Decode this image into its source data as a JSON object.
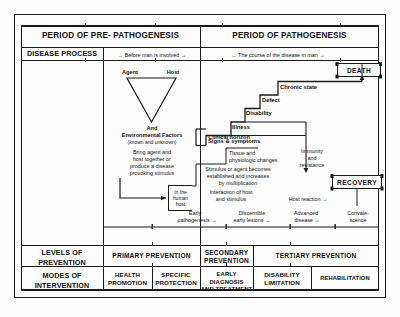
{
  "diagram": {
    "periods": [
      {
        "label": "PERIOD OF PRE- PATHOGENESIS"
      },
      {
        "label": "PERIOD OF PATHOGENESIS"
      }
    ],
    "row_labels": {
      "disease_process": "DISEASE PROCESS",
      "levels_of_prevention": "LEVELS OF\nPREVENTION",
      "modes_of_intervention": "MODES OF\nINTERVENTION"
    },
    "disease_process": {
      "pre": "Before man is involved",
      "path": "The course of the disease in man",
      "arrow_left": "→",
      "arrow_right": "→"
    },
    "epidemiologic_triad": {
      "agent": "Agent",
      "host": "Host",
      "and": "And",
      "environmental_factors": "Environmental Factors",
      "known_unknown": "(known  and unknown)",
      "action_line1": "Bring agent and",
      "action_line2": "host together or",
      "action_line3": "produce  a disease",
      "action_line4": "provoking stimulus"
    },
    "human_host_box": {
      "line1": "In the",
      "line2": "human",
      "line3": "host"
    },
    "pathogenesis_notes": {
      "interaction_line1": "Interaction of host",
      "interaction_line2": "and stimulus",
      "stimulus_line1": "Stimulus or agent becomes",
      "stimulus_line2": "established  and increases",
      "stimulus_line3": "by multiplication",
      "tissue_line1": "Tissue and",
      "tissue_line2": "physiologic changes",
      "clinical_horizon": "Clinical horizon",
      "immunity_line1": "Immunity",
      "immunity_line2": "and",
      "immunity_line3": "resistance",
      "host_reaction": "Host reaction",
      "host_reaction_arrow": "→"
    },
    "outcomes": {
      "death": "DEATH",
      "recovery": "RECOVERY"
    },
    "steps": [
      {
        "label": "Signs & symptoms"
      },
      {
        "label": "Illness"
      },
      {
        "label": "Disability"
      },
      {
        "label": "Defect"
      },
      {
        "label": "Chronic state"
      }
    ],
    "stage_axis": [
      {
        "line1": "Early",
        "line2": "pathogenesis",
        "arrow": "→"
      },
      {
        "line1": "Discernible",
        "line2": "early lesions",
        "arrow": "→"
      },
      {
        "line1": "Advanced",
        "line2": "disease",
        "arrow": "→"
      },
      {
        "line1": "Convale-",
        "line2": "scence",
        "arrow": ""
      }
    ],
    "levels_of_prevention": [
      {
        "label": "PRIMARY PREVENTION"
      },
      {
        "label": "SECONDARY\nPREVENTION"
      },
      {
        "label": "TERTIARY PREVENTION"
      }
    ],
    "modes_of_intervention": [
      {
        "label": "HEALTH\nPROMOTION"
      },
      {
        "label": "SPECIFIC\nPROTECTION"
      },
      {
        "label": "EARLY DIAGNOSIS\nAND TREATMENT"
      },
      {
        "label": "DISABILITY\nLIMITATION"
      },
      {
        "label": "REHABILITATION"
      }
    ],
    "colors": {
      "ink": "#1a1a1a",
      "paper": "#fdfdfd"
    }
  }
}
